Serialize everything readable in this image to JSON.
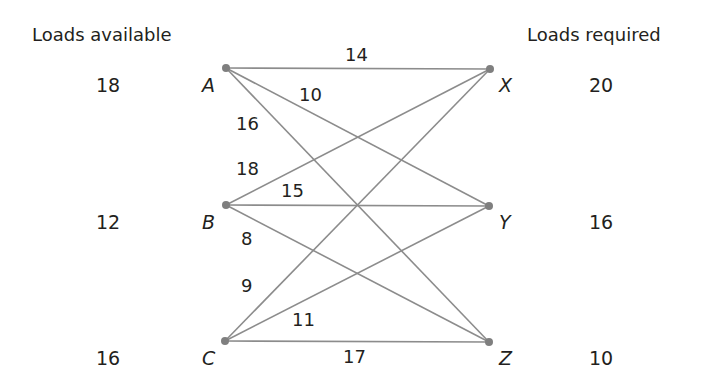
{
  "headers": {
    "left": "Loads available",
    "right": "Loads required"
  },
  "sources": [
    {
      "id": "A",
      "supply": "18"
    },
    {
      "id": "B",
      "supply": "12"
    },
    {
      "id": "C",
      "supply": "16"
    }
  ],
  "destinations": [
    {
      "id": "X",
      "demand": "20"
    },
    {
      "id": "Y",
      "demand": "16"
    },
    {
      "id": "Z",
      "demand": "10"
    }
  ],
  "edges": [
    {
      "from": "A",
      "to": "X",
      "weight": "14"
    },
    {
      "from": "A",
      "to": "Y",
      "weight": "10"
    },
    {
      "from": "A",
      "to": "Z",
      "weight": "16"
    },
    {
      "from": "B",
      "to": "X",
      "weight": "18"
    },
    {
      "from": "B",
      "to": "Y",
      "weight": "15"
    },
    {
      "from": "B",
      "to": "Z",
      "weight": "8"
    },
    {
      "from": "C",
      "to": "X",
      "weight": "9"
    },
    {
      "from": "C",
      "to": "Y",
      "weight": "11"
    },
    {
      "from": "C",
      "to": "Z",
      "weight": "17"
    }
  ],
  "colors": {
    "edge": "#8c8c8c",
    "node": "#7f7f7f",
    "text": "#231f20"
  }
}
